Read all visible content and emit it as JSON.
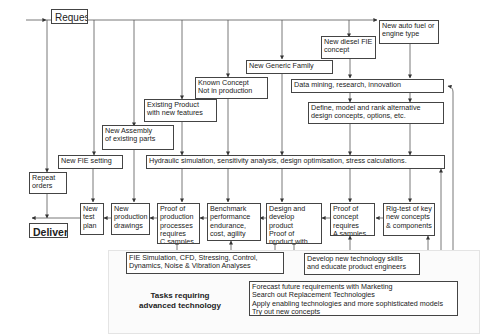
{
  "diagram": {
    "start": "Request",
    "end": "Delivery",
    "request_types": [
      {
        "id": "new_auto_fuel",
        "label": "New auto fuel or\nengine type"
      },
      {
        "id": "new_diesel_fie",
        "label": "New diesel FIE\nconcept"
      },
      {
        "id": "new_generic_family",
        "label": "New Generic Family"
      },
      {
        "id": "known_concept",
        "label": "Known Concept\nNot in production"
      },
      {
        "id": "existing_product",
        "label": "Existing Product\nwith new features"
      },
      {
        "id": "new_assembly",
        "label": "New Assembly\nof existing parts"
      },
      {
        "id": "new_fie_setting",
        "label": "New FIE setting"
      },
      {
        "id": "repeat_orders",
        "label": "Repeat\norders"
      }
    ],
    "process_steps": [
      {
        "id": "data_mining",
        "label": "Data mining, research, innovation"
      },
      {
        "id": "define_model",
        "label": "Define, model and rank alternative\ndesign concepts, options, etc."
      },
      {
        "id": "hydraulic_sim",
        "label": "Hydraulic simulation, sensitivity analysis, design optimisation, stress calculations."
      }
    ],
    "stages": [
      {
        "id": "rig_test",
        "label": "Rig-test of key\nnew concepts\n& components"
      },
      {
        "id": "proof_concept",
        "label": "Proof of\nconcept\nrequires\nA samples"
      },
      {
        "id": "design_develop",
        "label": "Design and\ndevelop product\nProof of\nproduct with\n B samples"
      },
      {
        "id": "benchmark",
        "label": "Benchmark\nperformance\nendurance,\ncost, agility"
      },
      {
        "id": "proof_production",
        "label": "Proof of\nproduction\nprocesses\nrequires\nC samples"
      },
      {
        "id": "new_prod_drawings",
        "label": "New\nproduction\ndrawings"
      },
      {
        "id": "new_test_plan",
        "label": "New\ntest\nplan"
      }
    ],
    "advanced_tasks": {
      "title": "Tasks requiring\nadvanced technology",
      "fie_simulation": "FIE Simulation, CFD, Stressing, Control,\nDynamics, Noise & Vibration Analyses",
      "develop_skills": "Develop new technology skills\nand educate product engineers",
      "forecast": "Forecast future requirements with Marketing\nSearch out Replacement Technologies\nApply enabling technologies and more sophisticated models\nTry out new concepts"
    }
  }
}
